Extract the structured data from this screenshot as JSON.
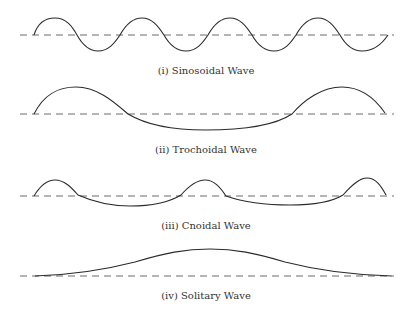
{
  "figure": {
    "panels": [
      {
        "id": "sinusoidal",
        "label": "(i) Sinosoidal Wave"
      },
      {
        "id": "trochoidal",
        "label": "(ii) Trochoidal Wave"
      },
      {
        "id": "cnoidal",
        "label": "(iii) Cnoidal Wave"
      },
      {
        "id": "solitary",
        "label": "(iv) Solitary Wave"
      }
    ],
    "colors": {
      "wave": "#2b2b2b",
      "baseline": "#6a6a6a",
      "background": "#ffffff"
    }
  }
}
